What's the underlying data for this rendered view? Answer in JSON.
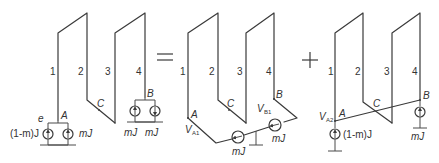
{
  "colors": {
    "line": "#3a3a3a",
    "text": "#333333",
    "background": "#ffffff"
  },
  "operators": {
    "equals": "=",
    "plus": "+"
  },
  "panel1": {
    "conductor_labels": [
      "1",
      "2",
      "3",
      "4"
    ],
    "nodes": {
      "A": "A",
      "B": "B",
      "C": "C",
      "e": "e"
    },
    "sources": {
      "left_a": "(1-m)J",
      "right_a": "mJ",
      "left_b": "mJ",
      "right_b": "mJ"
    }
  },
  "panel2": {
    "conductor_labels": [
      "1",
      "2",
      "3",
      "4"
    ],
    "nodes": {
      "A": "A",
      "B": "B",
      "C": "C"
    },
    "voltages": {
      "VA1_main": "V",
      "VA1_sub": "A1",
      "VB1_main": "V",
      "VB1_sub": "B1"
    },
    "sources": {
      "left": "mJ",
      "right": "mJ"
    }
  },
  "panel3": {
    "conductor_labels": [
      "1",
      "2",
      "3",
      "4"
    ],
    "nodes": {
      "A": "A",
      "B": "B",
      "C": "C"
    },
    "voltages": {
      "VA2_main": "V",
      "VA2_sub": "A2"
    },
    "sources": {
      "at_A": "(1-m)J",
      "at_B": "mJ"
    }
  }
}
